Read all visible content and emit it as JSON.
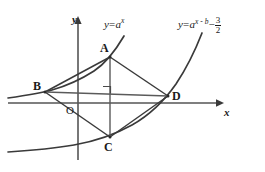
{
  "figure": {
    "type": "math-geometry-diagram",
    "background_color": "#ffffff",
    "stroke_color": "#3a3a3a",
    "text_color": "#1a1a1a"
  },
  "axes": {
    "x_label": "x",
    "y_label": "y",
    "origin_label": "O",
    "origin_px": {
      "x": 78,
      "y": 103
    },
    "x_axis": {
      "x1": 8,
      "y1": 103,
      "x2": 222,
      "y2": 103
    },
    "y_axis": {
      "x1": 78,
      "y1": 158,
      "x2": 78,
      "y2": 18
    }
  },
  "points": [
    {
      "name": "A",
      "label": "A",
      "x": 110,
      "y": 57,
      "label_x": 100,
      "label_y": 42
    },
    {
      "name": "B",
      "label": "B",
      "x": 45,
      "y": 92,
      "label_x": 33,
      "label_y": 80
    },
    {
      "name": "C",
      "label": "C",
      "x": 110,
      "y": 137,
      "label_x": 104,
      "label_y": 141
    },
    {
      "name": "D",
      "label": "D",
      "x": 168,
      "y": 96,
      "label_x": 172,
      "label_y": 90
    }
  ],
  "curves": [
    {
      "name": "curve-1",
      "label_html": "y = a^x",
      "label_x": 104,
      "label_y": 19,
      "parts": {
        "y_equals": "y",
        "equals": "=",
        "base": "a",
        "exponent": "x"
      }
    },
    {
      "name": "curve-2",
      "label_html": "y = a^(x-b) - 3/2",
      "label_x": 178,
      "label_y": 18,
      "parts": {
        "y_equals": "y",
        "equals": "=",
        "base": "a",
        "exponent": "x - b",
        "minus": "−",
        "fraction_numerator": "3",
        "fraction_denominator": "2"
      }
    }
  ],
  "markers": [
    {
      "name": "right-angle",
      "x": 110,
      "y": 92,
      "size": 7,
      "description": "right angle square at intersection of diagonals"
    }
  ],
  "segments": [
    {
      "name": "AB",
      "from": "A",
      "to": "B"
    },
    {
      "name": "BC",
      "from": "B",
      "to": "C"
    },
    {
      "name": "CD",
      "from": "C",
      "to": "D"
    },
    {
      "name": "DA",
      "from": "D",
      "to": "A"
    },
    {
      "name": "AC-diagonal",
      "from": "A",
      "to": "C"
    },
    {
      "name": "BD-diagonal",
      "from": "B",
      "to": "D"
    }
  ]
}
